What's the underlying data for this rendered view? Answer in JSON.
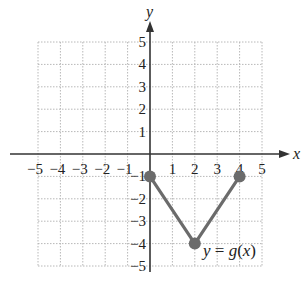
{
  "chart_data": {
    "type": "line",
    "title": "",
    "xlabel": "x",
    "ylabel": "y",
    "xlim": [
      -5,
      5
    ],
    "ylim": [
      -5,
      5
    ],
    "grid": true,
    "x_ticks": [
      "−5",
      "−4",
      "−3",
      "−2",
      "−1",
      "1",
      "2",
      "3",
      "4",
      "5"
    ],
    "y_ticks": [
      "5",
      "4",
      "3",
      "2",
      "1",
      "−1",
      "−2",
      "−3",
      "−4",
      "−5"
    ],
    "series": [
      {
        "name": "y = g(x)",
        "points": [
          [
            0,
            -1
          ],
          [
            2,
            -4
          ],
          [
            4,
            -1
          ]
        ],
        "color": "#6b6b6b",
        "markers": "filled-circle"
      }
    ],
    "annotations": [
      {
        "text": "y = g(x)",
        "x": 3.2,
        "y": -4.3
      }
    ]
  },
  "labels": {
    "x_axis": "x",
    "y_axis": "y",
    "curve": "y = g(x)"
  }
}
